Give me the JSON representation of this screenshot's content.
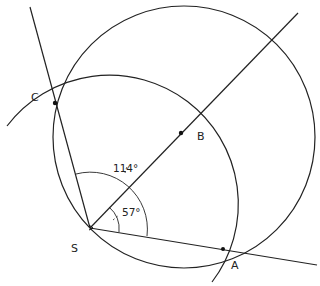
{
  "diagram": {
    "points": [
      {
        "id": "S",
        "label": "S",
        "x": 90,
        "y": 228
      },
      {
        "id": "C",
        "label": "C",
        "x": 55,
        "y": 103
      },
      {
        "id": "B",
        "label": "B",
        "x": 181,
        "y": 133
      },
      {
        "id": "A",
        "label": "A",
        "x": 224,
        "y": 249
      }
    ],
    "angles": [
      {
        "label": "114°",
        "between": [
          "SA",
          "SC"
        ]
      },
      {
        "label": "57°",
        "between": [
          "SA",
          "SB"
        ]
      }
    ],
    "stroke_color": "#222222"
  }
}
